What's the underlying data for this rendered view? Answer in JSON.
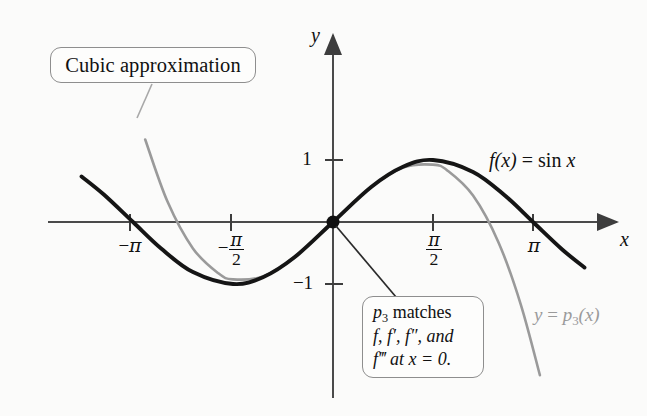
{
  "figure": {
    "background_color": "#fbfbfa",
    "curve_colors": {
      "sine": "#151515",
      "cubic": "#9a9a9a",
      "axis": "#4a4a4a"
    }
  },
  "axes": {
    "y_axis_label": "y",
    "x_axis_label": "x",
    "x_ticks": [
      {
        "label_html": "−<span class=\"pi\">π</span>",
        "value": -3.14159,
        "px": 130
      },
      {
        "label_html": "−frac",
        "value": -1.5708,
        "px": 231
      },
      {
        "label_html": "frac",
        "value": 1.5708,
        "px": 433
      },
      {
        "label_html": "<span class=\"pi\">π</span>",
        "value": 3.14159,
        "px": 533
      }
    ],
    "y_ticks": [
      {
        "label": "1",
        "value": 1,
        "px": 160
      },
      {
        "label": "−1",
        "value": -1,
        "px": 284
      }
    ],
    "origin": {
      "x": 333,
      "y": 222
    }
  },
  "labels": {
    "cubic_callout": "Cubic approximation",
    "p3_callout": {
      "line1_pre": "p",
      "line1_sub": "3",
      "line1_post": " matches",
      "line2": "f, f′, f″, and",
      "line3_pre": "f‴",
      "line3_post": " at x = 0."
    },
    "sine_curve": "f(x) = sin x",
    "cubic_curve_pre": "y = p",
    "cubic_curve_sub": "3",
    "cubic_curve_post": "(x)"
  },
  "chart_data": {
    "type": "line",
    "title": "",
    "xlabel": "x",
    "ylabel": "y",
    "xlim": [
      -4.0,
      4.3
    ],
    "ylim": [
      -2.6,
      2.9
    ],
    "grid": false,
    "legend": "inline-labels",
    "xtick_values": [
      -3.14159,
      -1.5708,
      1.5708,
      3.14159
    ],
    "xtick_labels": [
      "−π",
      "−π/2",
      "π/2",
      "π"
    ],
    "ytick_values": [
      1,
      -1
    ],
    "ytick_labels": [
      "1",
      "−1"
    ],
    "annotations": [
      {
        "text": "Cubic approximation",
        "points_to": "cubic curve, upper-left branch"
      },
      {
        "text": "p3 matches f, f', f'', and f''' at x = 0.",
        "points_to": "origin (0, 0)"
      }
    ],
    "series": [
      {
        "name": "f(x) = sin x",
        "color": "#151515",
        "formula": "sin(x)",
        "x": [
          -3.95,
          -3.6,
          -3.14159,
          -2.7,
          -2.2,
          -1.5708,
          -1.1,
          -0.6,
          0,
          0.6,
          1.1,
          1.5708,
          2.2,
          2.7,
          3.14159,
          3.6,
          3.95
        ],
        "y": [
          0.734,
          0.443,
          0.0,
          -0.427,
          -0.808,
          -1.0,
          -0.891,
          -0.565,
          0.0,
          0.565,
          0.891,
          1.0,
          0.808,
          0.427,
          0.0,
          -0.443,
          -0.734
        ]
      },
      {
        "name": "y = p3(x)",
        "color": "#9a9a9a",
        "formula": "x - x^3/6",
        "x": [
          -2.95,
          -2.6,
          -2.2,
          -1.8,
          -1.5708,
          -1.1,
          -0.6,
          0,
          0.6,
          1.1,
          1.5708,
          1.8,
          2.2,
          2.6,
          2.95,
          3.25
        ],
        "y": [
          1.331,
          0.329,
          -0.426,
          -0.828,
          -0.925,
          -0.878,
          -0.564,
          0.0,
          0.564,
          0.878,
          0.925,
          0.828,
          0.426,
          -0.329,
          -1.331,
          -2.47
        ]
      }
    ]
  }
}
